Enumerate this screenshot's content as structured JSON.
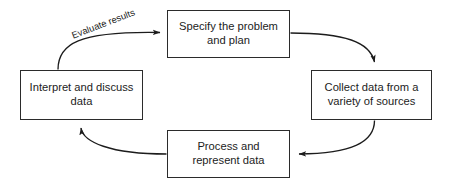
{
  "diagram": {
    "type": "cycle-flowchart",
    "direction": "clockwise",
    "background_color": "#ffffff",
    "line_color": "#2b2b2b",
    "text_color": "#1c1c1c",
    "nodes": [
      {
        "id": "specify",
        "label": "Specify the problem\nand plan",
        "position": "top"
      },
      {
        "id": "collect",
        "label": "Collect data from a\nvariety of sources",
        "position": "right"
      },
      {
        "id": "process",
        "label": "Process and\nrepresent data",
        "position": "bottom"
      },
      {
        "id": "interpret",
        "label": "Interpret and discuss\ndata",
        "position": "left"
      }
    ],
    "edges": [
      {
        "id": "specify-to-collect",
        "from": "specify",
        "to": "collect",
        "label": ""
      },
      {
        "id": "collect-to-process",
        "from": "collect",
        "to": "process",
        "label": ""
      },
      {
        "id": "process-to-interpret",
        "from": "process",
        "to": "interpret",
        "label": ""
      },
      {
        "id": "interpret-to-specify",
        "from": "interpret",
        "to": "specify",
        "label": "Evaluate results"
      }
    ]
  }
}
